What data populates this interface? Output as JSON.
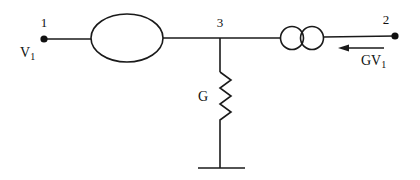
{
  "diagram": {
    "type": "circuit-equivalent",
    "stroke_color": "#1a1a1a",
    "nodes": [
      {
        "id": "1",
        "label": "1",
        "x": 44,
        "y": 39
      },
      {
        "id": "2",
        "label": "2",
        "x": 395,
        "y": 36
      },
      {
        "id": "3",
        "label": "3",
        "x": 220,
        "y": 38
      }
    ],
    "labels": {
      "node1": "1",
      "node2": "2",
      "node3": "3",
      "v1_main": "V",
      "v1_sub": "1",
      "gv1_main": "GV",
      "gv1_sub": "1",
      "g": "G"
    },
    "elements": [
      {
        "kind": "impedance-ellipse",
        "between": [
          "1",
          "3"
        ]
      },
      {
        "kind": "transformer-two-circles",
        "between": [
          "3",
          "2"
        ]
      },
      {
        "kind": "resistor",
        "label": "G",
        "between": [
          "3",
          "ground"
        ]
      },
      {
        "kind": "ground"
      },
      {
        "kind": "current-arrow",
        "label": "GV1",
        "direction": "left"
      }
    ]
  }
}
